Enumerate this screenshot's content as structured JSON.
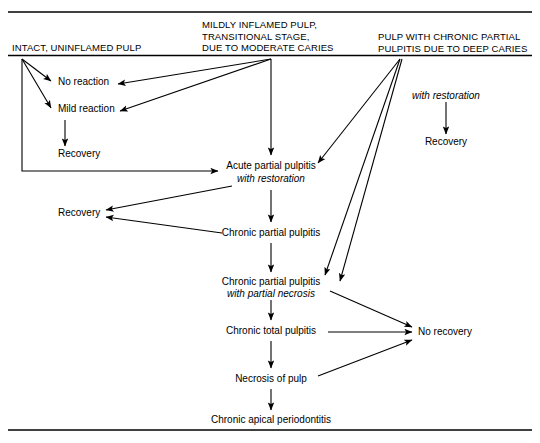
{
  "figure": {
    "type": "flowchart",
    "background_color": "#ffffff",
    "line_color": "#000000"
  },
  "columns": [
    {
      "id": "intact",
      "label": "INTACT, UNINFLAMED PULP"
    },
    {
      "id": "mildly-inflamed",
      "label": "MILDLY INFLAMED PULP,\nTRANSITIONAL STAGE,\nDUE TO MODERATE CARIES"
    },
    {
      "id": "chronic-partial",
      "label": "PULP WITH CHRONIC PARTIAL\nPULPITIS DUE TO DEEP CARIES"
    }
  ],
  "nodes": {
    "no_reaction": "No reaction",
    "mild_reaction": "Mild reaction",
    "recovery_left_top": "Recovery",
    "recovery_left_mid": "Recovery",
    "recovery_right": "Recovery",
    "with_restoration_right": "with restoration",
    "acute_partial_pulpitis": "Acute partial pulpitis",
    "acute_with_restoration": "with restoration",
    "chronic_partial_pulpitis": "Chronic partial pulpitis",
    "chronic_partial_necrosis": "Chronic partial pulpitis",
    "chronic_with_partial_necrosis": "with partial necrosis",
    "chronic_total_pulpitis": "Chronic total pulpitis",
    "necrosis_of_pulp": "Necrosis of pulp",
    "chronic_apical_periodontitis": "Chronic apical periodontitis",
    "no_recovery": "No recovery"
  }
}
